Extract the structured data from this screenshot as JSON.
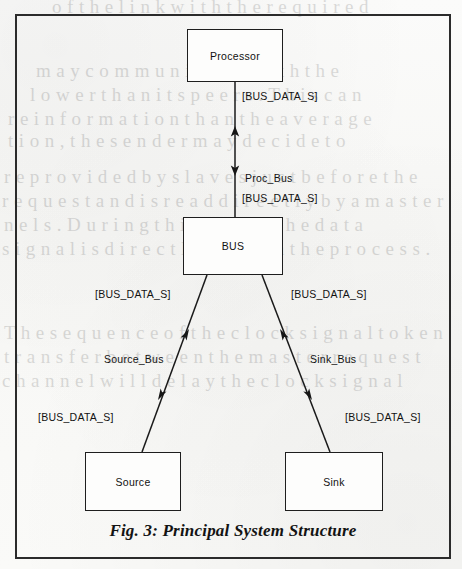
{
  "figure": {
    "caption": "Fig. 3: Principal System Structure",
    "frame_color": "#2b2b2b",
    "ink_color": "#1e1e1e",
    "paper_color": "#fdfdfc"
  },
  "blocks": [
    {
      "id": "processor",
      "label": "Processor"
    },
    {
      "id": "bus",
      "label": "BUS"
    },
    {
      "id": "source",
      "label": "Source"
    },
    {
      "id": "sink",
      "label": "Sink"
    }
  ],
  "edges": [
    {
      "id": "proc-bus",
      "name": "Proc_Bus",
      "from": "Processor",
      "to": "BUS",
      "upper_signal": "[BUS_DATA_S]",
      "lower_signal": "[BUS_DATA_S]",
      "direction": "bidirectional"
    },
    {
      "id": "source-bus",
      "name": "Source_Bus",
      "from": "Source",
      "to": "BUS",
      "upper_signal": "[BUS_DATA_S]",
      "lower_signal": "[BUS_DATA_S]",
      "direction": "bidirectional"
    },
    {
      "id": "sink-bus",
      "name": "Sink_Bus",
      "from": "Sink",
      "to": "BUS",
      "upper_signal": "[BUS_DATA_S]",
      "lower_signal": "[BUS_DATA_S]",
      "direction": "bidirectional"
    }
  ],
  "labels": {
    "proc_top_signal": "[BUS_DATA_S]",
    "proc_bus_name": "Proc_Bus",
    "proc_bottom_signal": "[BUS_DATA_S]",
    "bus_left_signal": "[BUS_DATA_S]",
    "bus_right_signal": "[BUS_DATA_S]",
    "source_bus_name": "Source_Bus",
    "sink_bus_name": "Sink_Bus",
    "source_signal": "[BUS_DATA_S]",
    "sink_signal": "[BUS_DATA_S]"
  },
  "bleed_through": [
    {
      "text": "o f  t h e  l i n k  w i t h  t h e  r e q u i r e d",
      "x": 52,
      "y": -4
    },
    {
      "text": "m a y  c o m m u n i c a t e  w i t h  t h e",
      "x": 36,
      "y": 60
    },
    {
      "text": "l o w e r  t h a n  i t s  p e e r s .  T h i s  c a n",
      "x": 30,
      "y": 84
    },
    {
      "text": "r e  i n f o r m a t i o n  t h a n  t h e  a v e r a g e",
      "x": 8,
      "y": 108
    },
    {
      "text": "t i o n ,  t h e  s e n d e r  m a y  d e c i d e  t o",
      "x": 8,
      "y": 130
    },
    {
      "text": "r e  p r o v i d e d  b y  s l a v e s  j u s t  b e f o r e  t h e",
      "x": 4,
      "y": 166
    },
    {
      "text": "r e q u e s t  a n d  i s  r e a d  d i r e c t l y  b y  a  m a s t e r",
      "x": 2,
      "y": 190
    },
    {
      "text": "n e l s .  D u r i n g  t h i s  p h a s e  t h e  d a t a",
      "x": 4,
      "y": 214
    },
    {
      "text": "s i g n a l  i s  d i r e c t l y  u s e d  i n  t h e  p r o c e s s .",
      "x": 2,
      "y": 238
    },
    {
      "text": "T h e  s e q u e n c e  o f  t h e  c l o c k  s i g n a l  t o k e n",
      "x": 4,
      "y": 322
    },
    {
      "text": "t r a n s f e r  b e t w e e n  t h e  m a s t e r  r e q u e s t",
      "x": 4,
      "y": 346
    },
    {
      "text": "c h a n n e l  w i l l  d e l a y  t h e  c l o c k  s i g n a l",
      "x": 2,
      "y": 370
    }
  ]
}
